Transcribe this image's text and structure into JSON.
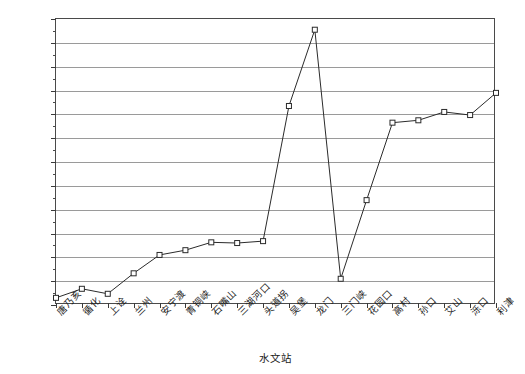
{
  "chart_data": {
    "type": "line",
    "title": "",
    "xlabel": "水文站",
    "ylabel": "输沙量/10⁴t",
    "ylim": [
      0,
      12
    ],
    "ytick_step": 1,
    "yticks": [
      "0",
      "1",
      "2",
      "3",
      "4",
      "5",
      "6",
      "7",
      "8",
      "9",
      "10",
      "11",
      "12"
    ],
    "grid": true,
    "legend": "none",
    "marker": "open-square",
    "categories": [
      "唐乃亥",
      "循化",
      "上诠",
      "兰州",
      "安宁渡",
      "青铜峡",
      "石嘴山",
      "三湖河口",
      "头道拐",
      "吴堡",
      "龙门",
      "三门峡",
      "花园口",
      "高村",
      "孙口",
      "艾山",
      "泺口",
      "利津"
    ],
    "values": [
      0.3,
      0.68,
      0.47,
      1.33,
      2.1,
      2.3,
      2.63,
      2.6,
      2.68,
      8.35,
      11.55,
      1.1,
      4.4,
      7.65,
      7.75,
      8.1,
      7.97,
      8.9
    ],
    "series": [
      {
        "name": "输沙量",
        "values": [
          0.3,
          0.68,
          0.47,
          1.33,
          2.1,
          2.3,
          2.63,
          2.6,
          2.68,
          8.35,
          11.55,
          1.1,
          4.4,
          7.65,
          7.75,
          8.1,
          7.97,
          8.9
        ]
      }
    ],
    "colors": {
      "line": "#2b2b2b",
      "marker_fill": "#ffffff",
      "marker_stroke": "#2b2b2b",
      "grid": "#9a9a9a",
      "frame": "#4a4a4a"
    }
  }
}
